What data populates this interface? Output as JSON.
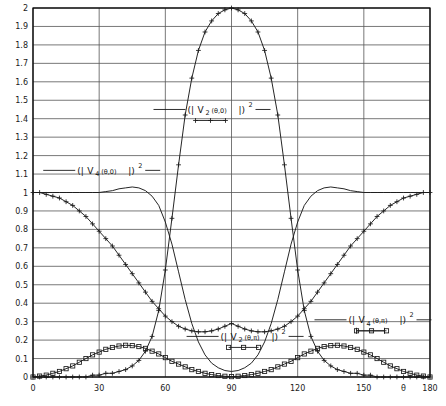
{
  "chart_data": {
    "type": "line",
    "title": "",
    "xlabel": "θ",
    "ylabel": "",
    "xlim": [
      0,
      180
    ],
    "ylim": [
      0,
      2
    ],
    "xticks": [
      0,
      30,
      60,
      90,
      120,
      150,
      180
    ],
    "xticklabels": [
      "0",
      "30",
      "60",
      "90",
      "120",
      "150",
      "180"
    ],
    "yticks": [
      0,
      0.1,
      0.2,
      0.3,
      0.4,
      0.5,
      0.6,
      0.7,
      0.8,
      0.9,
      1,
      1.1,
      1.2,
      1.3,
      1.4,
      1.5,
      1.6,
      1.7,
      1.8,
      1.9,
      2
    ],
    "yticklabels": [
      "0",
      "0.1",
      "0.2",
      "0.3",
      "0.4",
      "0.5",
      "0.6",
      "0.7",
      "0.8",
      "0.9",
      "1",
      "1.1",
      "1.2",
      "1.3",
      "1.4",
      "1.5",
      "1.6",
      "1.7",
      "1.8",
      "1.9",
      "2"
    ],
    "grid": true,
    "grid_x": true,
    "grid_y": true,
    "legend_position": "inline-annotations",
    "axis_symbol": "θ",
    "series": [
      {
        "name": "(| V_2(θ,0) |)^2",
        "label_parts": {
          "open": "(|",
          "V": "V",
          "sub": "2",
          "arg": "(θ,0)",
          "close": "|)",
          "sup": "2"
        },
        "marker": "cross",
        "x": [
          0,
          3,
          6,
          9,
          12,
          15,
          18,
          21,
          24,
          27,
          30,
          33,
          36,
          39,
          42,
          45,
          48,
          51,
          54,
          57,
          60,
          63,
          66,
          69,
          72,
          75,
          78,
          81,
          84,
          87,
          90,
          93,
          96,
          99,
          102,
          105,
          108,
          111,
          114,
          117,
          120,
          123,
          126,
          129,
          132,
          135,
          138,
          141,
          144,
          147,
          150,
          153,
          156,
          159,
          162,
          165,
          168,
          171,
          174,
          177,
          180
        ],
        "values": [
          0,
          0,
          0,
          0,
          0,
          0,
          0,
          0,
          0,
          0.01,
          0.01,
          0.02,
          0.02,
          0.03,
          0.04,
          0.06,
          0.09,
          0.14,
          0.22,
          0.36,
          0.58,
          0.86,
          1.15,
          1.42,
          1.62,
          1.77,
          1.87,
          1.93,
          1.97,
          1.99,
          2.0,
          1.99,
          1.97,
          1.93,
          1.87,
          1.77,
          1.62,
          1.42,
          1.15,
          0.86,
          0.58,
          0.36,
          0.22,
          0.14,
          0.09,
          0.06,
          0.04,
          0.03,
          0.02,
          0.02,
          0.01,
          0.01,
          0,
          0,
          0,
          0,
          0,
          0,
          0,
          0,
          0
        ]
      },
      {
        "name": "(| V_4(θ,0) |)^2",
        "label_parts": {
          "open": "(|",
          "V": "V",
          "sub": "4",
          "arg": "(θ,0)",
          "close": "|)",
          "sup": "2"
        },
        "marker": "cross",
        "x": [
          0,
          3,
          6,
          9,
          12,
          15,
          18,
          21,
          24,
          27,
          30,
          33,
          36,
          39,
          42,
          45,
          48,
          51,
          54,
          57,
          60,
          63,
          66,
          69,
          72,
          75,
          78,
          81,
          84,
          87,
          90,
          93,
          96,
          99,
          102,
          105,
          108,
          111,
          114,
          117,
          120,
          123,
          126,
          129,
          132,
          135,
          138,
          141,
          144,
          147,
          150,
          153,
          156,
          159,
          162,
          165,
          168,
          171,
          174,
          177,
          180
        ],
        "values": [
          1.0,
          1.0,
          0.99,
          0.98,
          0.97,
          0.95,
          0.93,
          0.9,
          0.87,
          0.83,
          0.79,
          0.75,
          0.71,
          0.66,
          0.61,
          0.56,
          0.51,
          0.46,
          0.41,
          0.37,
          0.33,
          0.3,
          0.275,
          0.26,
          0.25,
          0.245,
          0.245,
          0.25,
          0.26,
          0.275,
          0.29,
          0.275,
          0.26,
          0.25,
          0.245,
          0.245,
          0.25,
          0.26,
          0.275,
          0.3,
          0.33,
          0.37,
          0.41,
          0.46,
          0.51,
          0.56,
          0.61,
          0.66,
          0.71,
          0.75,
          0.79,
          0.83,
          0.87,
          0.9,
          0.93,
          0.95,
          0.97,
          0.98,
          0.99,
          1.0,
          1.0
        ]
      },
      {
        "name": "(| V_2(θ,π) |)^2",
        "label_parts": {
          "open": "(|",
          "V": "V",
          "sub": "2",
          "arg": "(θ,π)",
          "close": "|)",
          "sup": "2"
        },
        "marker": "square",
        "x": [
          0,
          3,
          6,
          9,
          12,
          15,
          18,
          21,
          24,
          27,
          30,
          33,
          36,
          39,
          42,
          45,
          48,
          51,
          54,
          57,
          60,
          63,
          66,
          69,
          72,
          75,
          78,
          81,
          84,
          87,
          90,
          93,
          96,
          99,
          102,
          105,
          108,
          111,
          114,
          117,
          120,
          123,
          126,
          129,
          132,
          135,
          138,
          141,
          144,
          147,
          150,
          153,
          156,
          159,
          162,
          165,
          168,
          171,
          174,
          177,
          180
        ],
        "values": [
          0,
          0.005,
          0.01,
          0.02,
          0.03,
          0.045,
          0.06,
          0.08,
          0.1,
          0.12,
          0.135,
          0.15,
          0.16,
          0.168,
          0.172,
          0.17,
          0.165,
          0.155,
          0.14,
          0.125,
          0.105,
          0.085,
          0.07,
          0.055,
          0.04,
          0.03,
          0.02,
          0.013,
          0.008,
          0.004,
          0.002,
          0.004,
          0.008,
          0.013,
          0.02,
          0.03,
          0.04,
          0.055,
          0.07,
          0.085,
          0.105,
          0.125,
          0.14,
          0.155,
          0.165,
          0.17,
          0.172,
          0.168,
          0.16,
          0.15,
          0.135,
          0.12,
          0.1,
          0.08,
          0.06,
          0.045,
          0.03,
          0.02,
          0.01,
          0.005,
          0
        ]
      },
      {
        "name": "(| V_4(θ,π) |)^2",
        "label_parts": {
          "open": "(|",
          "V": "V",
          "sub": "4",
          "arg": "(θ,π)",
          "close": "|)",
          "sup": "2"
        },
        "marker": "smooth",
        "x": [
          0,
          3,
          6,
          9,
          12,
          15,
          18,
          21,
          24,
          27,
          30,
          33,
          36,
          39,
          42,
          45,
          48,
          51,
          54,
          57,
          60,
          63,
          66,
          69,
          72,
          75,
          78,
          81,
          84,
          87,
          90,
          93,
          96,
          99,
          102,
          105,
          108,
          111,
          114,
          117,
          120,
          123,
          126,
          129,
          132,
          135,
          138,
          141,
          144,
          147,
          150,
          153,
          156,
          159,
          162,
          165,
          168,
          171,
          174,
          177,
          180
        ],
        "values": [
          1.0,
          1.0,
          1.0,
          1.0,
          1.0,
          1.0,
          1.0,
          1.0,
          1.0,
          1.0,
          1.0,
          1.005,
          1.01,
          1.02,
          1.025,
          1.03,
          1.025,
          1.01,
          0.98,
          0.93,
          0.84,
          0.72,
          0.57,
          0.42,
          0.29,
          0.19,
          0.12,
          0.075,
          0.05,
          0.035,
          0.03,
          0.035,
          0.05,
          0.075,
          0.12,
          0.19,
          0.29,
          0.42,
          0.57,
          0.72,
          0.84,
          0.93,
          0.98,
          1.01,
          1.025,
          1.03,
          1.025,
          1.02,
          1.01,
          1.005,
          1.0,
          1.0,
          1.0,
          1.0,
          1.0,
          1.0,
          1.0,
          1.0,
          1.0,
          1.0,
          1.0
        ]
      }
    ],
    "annotations": [
      {
        "id": "ann-v2-theta-0",
        "text": "(| V 2 (θ,0) |)2",
        "x": 90,
        "y": 1.45
      },
      {
        "id": "ann-v4-theta-0",
        "text": "(| V 4 (θ,0) |)2",
        "x": 40,
        "y": 1.12
      },
      {
        "id": "ann-v2-theta-pi",
        "text": "(| V 2 (θ,π) |)2",
        "x": 105,
        "y": 0.22
      },
      {
        "id": "ann-v4-theta-pi",
        "text": "(| V 4 (θ,π) |)2",
        "x": 163,
        "y": 0.31
      }
    ],
    "colors": {
      "axis": "#000000",
      "grid": "#555555",
      "curve": "#1a1a1a",
      "background": "#ffffff"
    }
  }
}
